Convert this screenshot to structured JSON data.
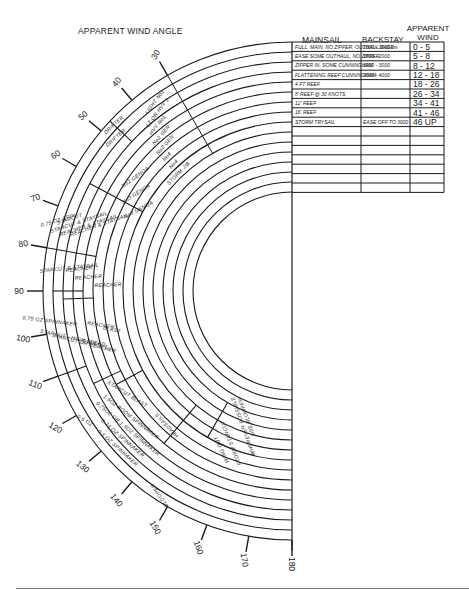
{
  "chart_title": "APPARENT WIND ANGLE",
  "table": {
    "headers": {
      "mainsail": "MAINSAIL",
      "backstay": "BACKSTAY",
      "apparent_wind_1": "APPARENT",
      "apparent_wind_2": "WIND"
    },
    "rows": [
      {
        "mainsail": "FULL, MAIN, NO ZIPPER, OUTHAUL EASE",
        "backstay": "1000 - 1500 lbs",
        "wind": "0 - 5"
      },
      {
        "mainsail": "EASE SOME OUTHAUL, NO ZIPPER",
        "backstay": "1500 - 2000",
        "wind": "5 - 8"
      },
      {
        "mainsail": "ZIPPER IN, SOME CUNNINGHAM",
        "backstay": "2000 - 3000",
        "wind": "8 - 12"
      },
      {
        "mainsail": "FLATTENING REEF CUNNINGHAM",
        "backstay": "3000 - 4000",
        "wind": "12 - 18"
      },
      {
        "mainsail": "4 FT REEF",
        "backstay": "",
        "wind": "18 - 26"
      },
      {
        "mainsail": "8' REEF @ 30 KNOTS",
        "backstay": "",
        "wind": "26 - 34"
      },
      {
        "mainsail": "12' REEF",
        "backstay": "",
        "wind": "34 - 41"
      },
      {
        "mainsail": "16' REEF",
        "backstay": "",
        "wind": "41 - 46"
      },
      {
        "mainsail": "STORM TRYSAIL",
        "backstay": "EASE OFF TO 3000",
        "wind": "46 UP"
      },
      {
        "mainsail": "",
        "backstay": "",
        "wind": ""
      },
      {
        "mainsail": "",
        "backstay": "",
        "wind": ""
      },
      {
        "mainsail": "",
        "backstay": "",
        "wind": ""
      },
      {
        "mainsail": "",
        "backstay": "",
        "wind": ""
      },
      {
        "mainsail": "",
        "backstay": "",
        "wind": ""
      },
      {
        "mainsail": "",
        "backstay": "",
        "wind": ""
      },
      {
        "mainsail": "",
        "backstay": "",
        "wind": ""
      }
    ]
  },
  "angle_ticks": [
    "30",
    "40",
    "50",
    "60",
    "70",
    "80",
    "90",
    "100",
    "110",
    "120",
    "130",
    "140",
    "150",
    "160",
    "170",
    "180"
  ],
  "sail_labels": [
    {
      "text": "LIGHT No1",
      "ring": 2,
      "angle": 36
    },
    {
      "text": "LT OR HVY 1",
      "ring": 3,
      "angle": 37
    },
    {
      "text": "HVY No1",
      "ring": 4,
      "angle": 39
    },
    {
      "text": "No2 GEN",
      "ring": 5,
      "angle": 40
    },
    {
      "text": "No3 GEN",
      "ring": 6,
      "angle": 41
    },
    {
      "text": "No4",
      "ring": 7,
      "angle": 43
    },
    {
      "text": "No4",
      "ring": 8,
      "angle": 43
    },
    {
      "text": "STORM JIB",
      "ring": 9,
      "angle": 44
    },
    {
      "text": "DRIFTER",
      "ring": 1,
      "angle": 47
    },
    {
      "text": "DRIFTER",
      "ring": 2,
      "angle": 49
    },
    {
      "text": "No2 GENOA",
      "ring": 6,
      "angle": 54
    },
    {
      "text": "No3 GENOA",
      "ring": 7,
      "angle": 58
    },
    {
      "text": "No3 GENOA",
      "ring": 8,
      "angle": 62
    },
    {
      "text": "0.75 OZ SPIN.",
      "ring": 1,
      "angle": 73
    },
    {
      "text": "STARCUT",
      "ring": 2,
      "angle": 72
    },
    {
      "text": "STARCUT & STAYSAIL",
      "ring": 3,
      "angle": 72
    },
    {
      "text": "REACHER & STAYSAIL",
      "ring": 4,
      "angle": 72
    },
    {
      "text": "REACHER & STAYSAIL",
      "ring": 5,
      "angle": 71
    },
    {
      "text": "STARCUT & STAYSAIL",
      "ring": 3,
      "angle": 84
    },
    {
      "text": "REACHER",
      "ring": 4,
      "angle": 84
    },
    {
      "text": "REACHER",
      "ring": 5,
      "angle": 86
    },
    {
      "text": "REACHER",
      "ring": 7,
      "angle": 88
    },
    {
      "text": "0.75 OZ SPINNAKER",
      "ring": 1,
      "angle": 97
    },
    {
      "text": "STARCUT - HIGH SPEED",
      "ring": 3,
      "angle": 102
    },
    {
      "text": "STARCUT OR REACHER",
      "ring": 4,
      "angle": 104
    },
    {
      "text": "STARCUT",
      "ring": 5,
      "angle": 105
    },
    {
      "text": "REACHER",
      "ring": 6,
      "angle": 100
    },
    {
      "text": "BLAST",
      "ring": 7,
      "angle": 102
    },
    {
      "text": "0.5 OZ",
      "ring": 1,
      "angle": 122
    },
    {
      "text": "0.5 OZ SPINNAKER",
      "ring": 2,
      "angle": 132
    },
    {
      "text": "0.75 OZ SPINNAKER",
      "ring": 3,
      "angle": 131
    },
    {
      "text": "0.75OZ OR 1.5OZ SPINNAKER",
      "ring": 4,
      "angle": 130
    },
    {
      "text": "1.5OZ BOOM SPINNAKER",
      "ring": 5,
      "angle": 128
    },
    {
      "text": "STARCUT BLAST",
      "ring": 6,
      "angle": 122
    },
    {
      "text": "HEADSAILS",
      "ring": 7,
      "angle": 137
    },
    {
      "text": "WING OUT",
      "ring": 8,
      "angle": 156
    },
    {
      "text": "STORM STARCUT",
      "ring": 9,
      "angle": 158
    },
    {
      "text": "WHEREVER POSSIBLE",
      "ring": 11,
      "angle": 160
    },
    {
      "text": "USE BLOOPER",
      "ring": 12,
      "angle": 160
    },
    {
      "text": "BLOOPER",
      "ring": 1,
      "angle": 147
    }
  ],
  "chart_data": {
    "type": "table",
    "title": "APPARENT WIND ANGLE",
    "angle_range": [
      30,
      180
    ],
    "angle_ticks": [
      30,
      40,
      50,
      60,
      70,
      80,
      90,
      100,
      110,
      120,
      130,
      140,
      150,
      160,
      170,
      180
    ],
    "wind_bands": [
      "0-5",
      "5-8",
      "8-12",
      "12-18",
      "18-26",
      "26-34",
      "34-41",
      "41-46",
      "46 UP"
    ],
    "mainsail": [
      "FULL MAIN, NO ZIPPER, OUTHAUL EASE",
      "EASE SOME OUTHAUL, NO ZIPPER",
      "ZIPPER IN, SOME CUNNINGHAM",
      "FLATTENING REEF CUNNINGHAM",
      "4 FT REEF",
      "8' REEF @ 30 KNOTS",
      "12' REEF",
      "16' REEF",
      "STORM TRYSAIL"
    ],
    "backstay": [
      "1000-1500 lbs",
      "1500-2000",
      "2000-3000",
      "3000-4000",
      "",
      "",
      "",
      "",
      "EASE OFF TO 3000"
    ]
  }
}
